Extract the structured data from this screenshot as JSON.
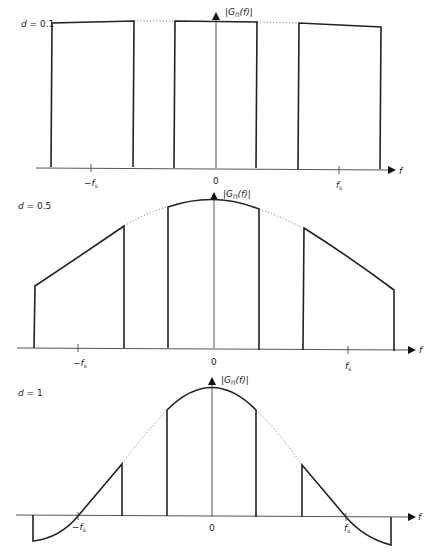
{
  "figure": {
    "panels": [
      {
        "id": "d01",
        "duty_label": "d = 0.1",
        "y_axis_label": "|GΠ(f)|",
        "y_axis_sub": "Π",
        "x_axis_label": "f",
        "ticks": [
          "−fs",
          "0",
          "fs"
        ]
      },
      {
        "id": "d05",
        "duty_label": "d = 0.5",
        "y_axis_label": "|GΠ(f)|",
        "x_axis_label": "f",
        "ticks": [
          "−fs",
          "0",
          "fs"
        ]
      },
      {
        "id": "d1",
        "duty_label": "d = 1",
        "y_axis_label": "|GΠ(f)|",
        "x_axis_label": "f",
        "ticks": [
          "−fs",
          "0",
          "fs"
        ]
      }
    ],
    "text": {
      "d": "d",
      "eq01": " = 0.1",
      "eq05": " = 0.5",
      "eq1": " = 1",
      "G_open": "|G",
      "G_sub": "Π",
      "G_close": "(f)|",
      "f": "f",
      "minus": "−",
      "fs_f": "f",
      "fs_sub": "s",
      "zero": "0"
    }
  }
}
